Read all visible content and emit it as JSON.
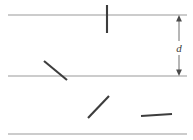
{
  "figure": {
    "background_color": "#ffffff",
    "width": 193,
    "height": 140
  },
  "dimension": {
    "label": "d",
    "name": "line-spacing",
    "color": "#4a4a4a",
    "axis_x": 179,
    "top_y": 15,
    "bottom_y": 76,
    "label_x": 179,
    "label_y": 48
  },
  "chart_data": {
    "type": "diagram",
    "xlabel": "",
    "ylabel": "",
    "xlim": [
      0,
      193
    ],
    "ylim": [
      0,
      140
    ],
    "grid": false,
    "legend": "none",
    "annotations": [
      {
        "text": "d",
        "x": 179,
        "y": 48,
        "kind": "dimension-label",
        "style": "italic"
      }
    ],
    "series": [
      {
        "name": "parallel lines",
        "kind": "line",
        "color": "#9a9a9a",
        "stroke_width": 1.1,
        "segments": [
          {
            "name": "top-line",
            "x1": 8,
            "y1": 15,
            "x2": 187,
            "y2": 15
          },
          {
            "name": "middle-line",
            "x1": 8,
            "y1": 76,
            "x2": 187,
            "y2": 76
          },
          {
            "name": "bottom-line",
            "x1": 8,
            "y1": 134,
            "x2": 187,
            "y2": 134
          }
        ]
      },
      {
        "name": "needles",
        "kind": "segment",
        "color": "#3d3d3d",
        "stroke_width": 2.1,
        "segments": [
          {
            "name": "needle-vertical-crossing-top",
            "x1": 107,
            "y1": 5,
            "x2": 107,
            "y2": 33,
            "crosses": true
          },
          {
            "name": "needle-diagonal-crossing-middle",
            "x1": 44,
            "y1": 61,
            "x2": 67,
            "y2": 80,
            "crosses": true
          },
          {
            "name": "needle-diagonal-lower-left",
            "x1": 88,
            "y1": 118,
            "x2": 109,
            "y2": 96,
            "crosses": false
          },
          {
            "name": "needle-horizontal-lower-right",
            "x1": 141,
            "y1": 116,
            "x2": 172,
            "y2": 114,
            "crosses": false
          }
        ]
      }
    ],
    "dimension_arrow": {
      "name": "spacing-d",
      "label": "d",
      "x": 179,
      "y_from": 15,
      "y_to": 76,
      "double_headed": true,
      "color": "#4a4a4a"
    }
  }
}
